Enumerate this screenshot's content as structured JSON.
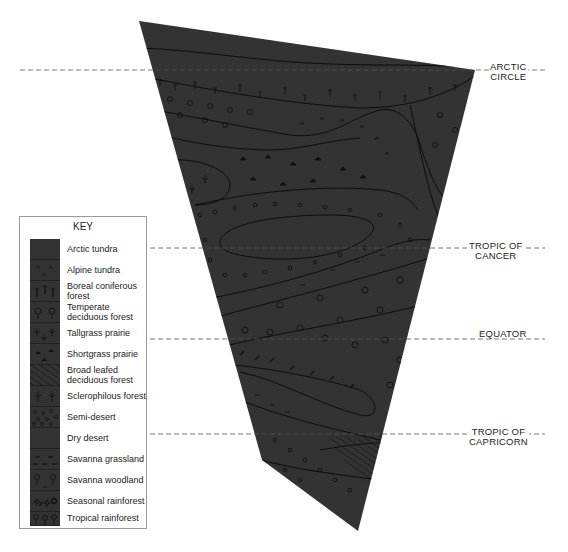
{
  "diagram": {
    "fill_color": "#333333",
    "pattern_color": "#111111",
    "outline_color": "#0d0d0d",
    "latitude_lines": [
      {
        "id": "arctic-circle",
        "label_line1": "ARCTIC",
        "label_line2": "CIRCLE",
        "y": 70
      },
      {
        "id": "tropic-of-cancer",
        "label_line1": "TROPIC OF",
        "label_line2": "CANCER",
        "y": 248
      },
      {
        "id": "equator",
        "label_line1": "EQUATOR",
        "label_line2": "",
        "y": 339
      },
      {
        "id": "tropic-of-capricorn",
        "label_line1": "TROPIC OF",
        "label_line2": "CAPRICORN",
        "y": 434
      }
    ]
  },
  "key": {
    "title": "KEY",
    "items": [
      {
        "label": "Arctic tundra",
        "symbol": "none"
      },
      {
        "label": "Alpine tundra",
        "symbol": "caret"
      },
      {
        "label": "Boreal coniferous forest",
        "symbol": "conifer"
      },
      {
        "label": "Temperate deciduous forest",
        "symbol": "round-tree"
      },
      {
        "label": "Tallgrass prairie",
        "symbol": "tall-grass"
      },
      {
        "label": "Shortgrass prairie",
        "symbol": "short-grass"
      },
      {
        "label": "Broad leafed deciduous forest",
        "symbol": "hatch"
      },
      {
        "label": "Sclerophilous forest",
        "symbol": "shrub"
      },
      {
        "label": "Semi-desert",
        "symbol": "circles"
      },
      {
        "label": "Dry desert",
        "symbol": "none"
      },
      {
        "label": "Savanna grassland",
        "symbol": "dashes"
      },
      {
        "label": "Savanna woodland",
        "symbol": "sparse-tree"
      },
      {
        "label": "Seasonal rainforest",
        "symbol": "dense-leaf"
      },
      {
        "label": "Tropical rainforest",
        "symbol": "broad-tree"
      }
    ]
  }
}
